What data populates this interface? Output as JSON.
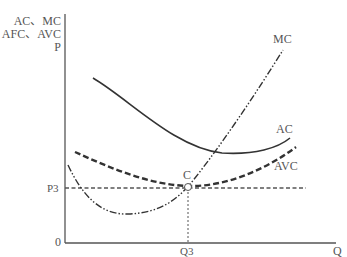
{
  "diagram": {
    "type": "cost-curves",
    "y_axis_label_lines": [
      "AC、MC",
      "AFC、AVC",
      "P"
    ],
    "x_axis_label": "Q",
    "origin_label": "0",
    "price_marker": "P3",
    "quantity_marker": "Q3",
    "point_label": "C",
    "curves": [
      {
        "name": "MC",
        "style": "dash-dot-dot"
      },
      {
        "name": "AC",
        "style": "solid"
      },
      {
        "name": "AVC",
        "style": "dashed"
      }
    ],
    "colors": {
      "line": "#333333",
      "axis": "#555555",
      "guide": "#555555"
    }
  }
}
